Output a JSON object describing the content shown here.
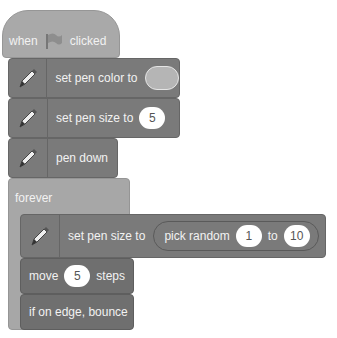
{
  "script": {
    "hat": {
      "pre": "when",
      "icon": "green-flag-icon",
      "post": "clicked"
    },
    "set_pen_color": {
      "label": "set pen color to",
      "color": "#b5b5b5"
    },
    "set_pen_size": {
      "label": "set pen size to",
      "value": "5"
    },
    "pen_down": {
      "label": "pen down"
    },
    "forever": {
      "label": "forever"
    },
    "inner_pen_size": {
      "label": "set pen size to",
      "reporter": "pick random",
      "from": "1",
      "to_label": "to",
      "to": "10"
    },
    "move": {
      "pre": "move",
      "value": "5",
      "post": "steps"
    },
    "bounce": {
      "label": "if on edge, bounce"
    }
  }
}
